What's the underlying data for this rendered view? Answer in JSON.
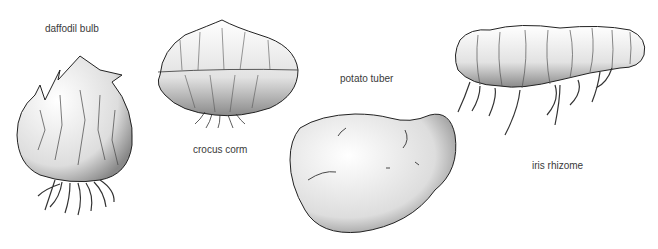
{
  "figure": {
    "items": [
      {
        "id": "daffodil",
        "label": "daffodil bulb"
      },
      {
        "id": "crocus",
        "label": "crocus corm"
      },
      {
        "id": "potato",
        "label": "potato tuber"
      },
      {
        "id": "iris",
        "label": "iris rhizome"
      }
    ]
  }
}
